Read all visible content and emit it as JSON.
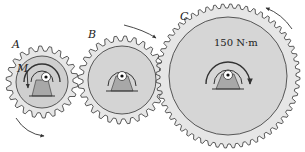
{
  "gears": [
    {
      "id": "A",
      "label": "A",
      "cx": 42,
      "cy": 82,
      "r_outer": 36,
      "r_root": 31,
      "r_inner": 26,
      "teeth": 22
    },
    {
      "id": "B",
      "label": "B",
      "cx": 122,
      "cy": 80,
      "r_outer": 44,
      "r_root": 39,
      "r_inner": 34,
      "teeth": 28
    },
    {
      "id": "C",
      "label": "C",
      "cx": 228,
      "cy": 76,
      "r_outer": 72,
      "r_root": 68,
      "r_inner": 59,
      "teeth": 56
    }
  ],
  "labels": {
    "gear_a": "A",
    "gear_b": "B",
    "gear_c": "C",
    "moment": "M",
    "torque_c": "150 N·m"
  },
  "colors": {
    "gear_fill": "#e4e4e4",
    "gear_inner": "#cfcfcf",
    "support": "#a8a8a8",
    "line": "#333333"
  }
}
